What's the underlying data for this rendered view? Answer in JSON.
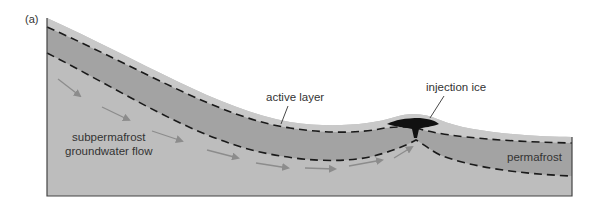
{
  "figure": {
    "panel_label": "(a)",
    "labels": {
      "active_layer": "active layer",
      "injection_ice": "injection ice",
      "subpermafrost_line1": "subpermafrost",
      "subpermafrost_line2": "groundwater flow",
      "permafrost": "permafrost"
    },
    "colors": {
      "background": "#ffffff",
      "active_layer_fill": "#c9c9c9",
      "permafrost_fill": "#a3a3a3",
      "subpermafrost_fill": "#bdbdbd",
      "ice_fill": "#111111",
      "dashed_line": "#1a1a1a",
      "arrow": "#8c8c8c",
      "outline": "#444444",
      "text": "#333333"
    }
  }
}
